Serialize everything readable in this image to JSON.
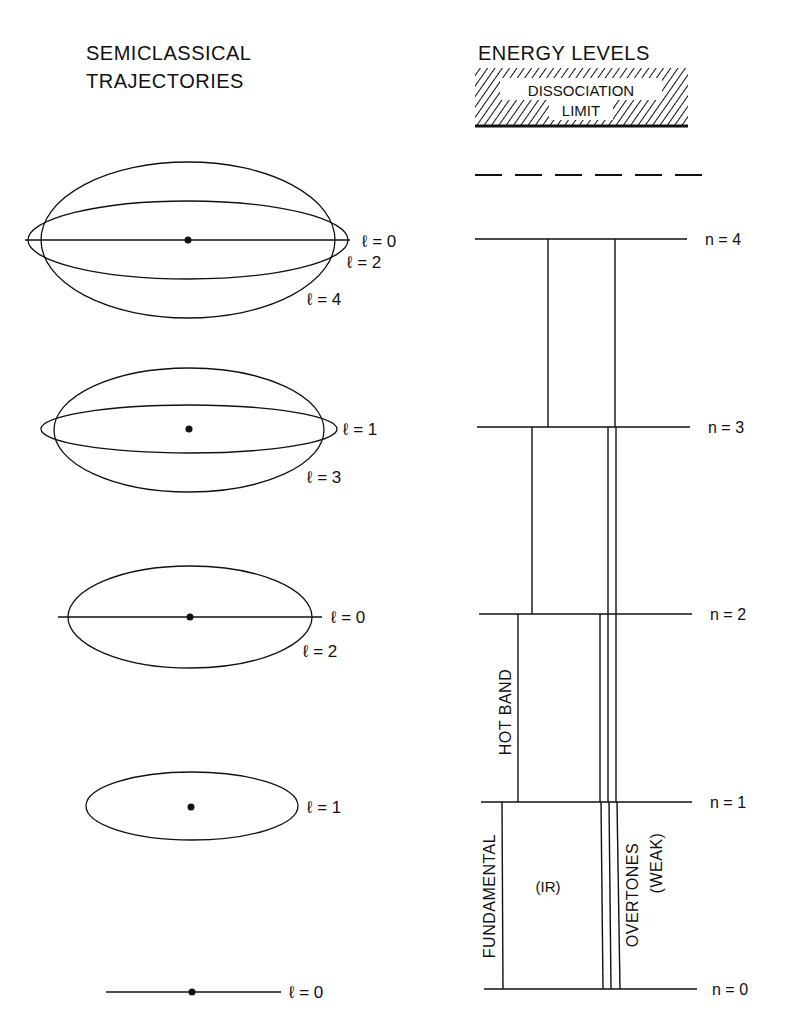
{
  "left_panel": {
    "title_line1": "SEMICLASSICAL",
    "title_line2": "TRAJECTORIES",
    "groups": [
      {
        "n": 4,
        "labels": [
          "ℓ = 0",
          "ℓ = 2",
          "ℓ = 4"
        ]
      },
      {
        "n": 3,
        "labels": [
          "ℓ = 1",
          "ℓ = 3"
        ]
      },
      {
        "n": 2,
        "labels": [
          "ℓ = 0",
          "ℓ = 2"
        ]
      },
      {
        "n": 1,
        "labels": [
          "ℓ = 1"
        ]
      },
      {
        "n": 0,
        "labels": [
          "ℓ = 0"
        ]
      }
    ]
  },
  "right_panel": {
    "title": "ENERGY LEVELS",
    "dissociation_line1": "DISSOCIATION",
    "dissociation_line2": "LIMIT",
    "levels": [
      "n = 4",
      "n = 3",
      "n = 2",
      "n = 1",
      "n = 0"
    ],
    "transitions": {
      "hot_band": "HOT BAND",
      "fundamental": "FUNDAMENTAL",
      "ir": "(IR)",
      "overtones": "OVERTONES",
      "weak": "(WEAK)"
    }
  },
  "colors": {
    "ink": "#111111",
    "background": "#ffffff"
  }
}
